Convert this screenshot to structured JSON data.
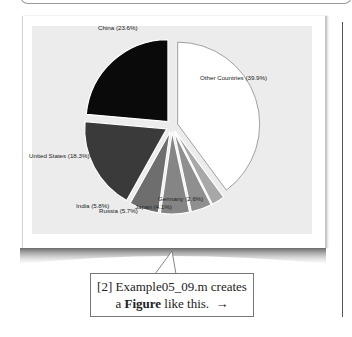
{
  "callout": {
    "line1": "[2] Example05_09.m creates",
    "line2_prefix": "a ",
    "line2_bold": "Figure",
    "line2_suffix": " like this.",
    "arrow": "→"
  },
  "chart_data": {
    "type": "pie",
    "title": "",
    "categories": [
      "China",
      "United States",
      "India",
      "Russia",
      "Japan",
      "Germany",
      "Other Countries"
    ],
    "values": [
      23.6,
      18.3,
      5.8,
      5.7,
      4.1,
      2.6,
      39.9
    ],
    "labels": [
      "China (23.6%)",
      "United States (18.3%)",
      "India (5.8%)",
      "Russia (5.7%)",
      "Japan (4.1%)",
      "Germany (2.6%)",
      "Other Countries (39.9%)"
    ],
    "colors": [
      "#0a0a0a",
      "#3a3a3a",
      "#6e6e6e",
      "#858585",
      "#8f8f8f",
      "#a8a8a8",
      "#ffffff"
    ],
    "exploded": [
      "China",
      "United States",
      "India",
      "Russia",
      "Japan",
      "Germany",
      "Other Countries"
    ],
    "legend": "none",
    "grid": false
  },
  "colors": {
    "plot_background": "#ececec",
    "slice_edge": "#ffffff",
    "other_outline": "#8a8a8a"
  }
}
